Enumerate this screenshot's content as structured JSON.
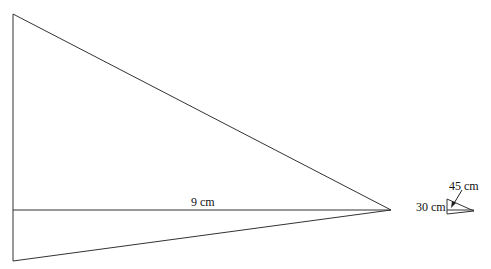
{
  "diagram": {
    "large_triangle": {
      "base_label": "9 cm",
      "stroke_color": "#333333"
    },
    "small_triangle": {
      "top_label": "45 cm",
      "side_label": "30 cm",
      "stroke_color": "#333333"
    }
  }
}
